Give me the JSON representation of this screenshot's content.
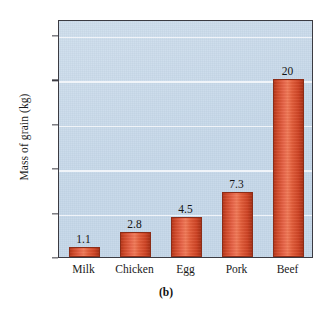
{
  "chart_data": {
    "type": "bar",
    "title": "",
    "subtitle": "",
    "categories": [
      "Milk",
      "Chicken",
      "Egg",
      "Pork",
      "Beef"
    ],
    "values": [
      1.1,
      2.8,
      4.5,
      7.3,
      20
    ],
    "value_labels": [
      "1.1",
      "2.8",
      "4.5",
      "7.3",
      "20"
    ],
    "xlabel": "",
    "ylabel": "Mass of grain (kg)",
    "ylim": [
      0,
      26.8
    ],
    "yticks": [
      0,
      5,
      10,
      15,
      20,
      25
    ],
    "ytick_labels": [
      "0",
      "5",
      "10",
      "15",
      "20",
      "25"
    ],
    "gridlines": [
      5,
      10,
      15,
      20,
      25
    ],
    "grid": true,
    "legend": null,
    "legend_position": "none",
    "caption": "(b)",
    "colors": {
      "plot_background": "#c3d6e8",
      "bar_fill": "#e35f3c",
      "bar_edge": "#8c2d18",
      "gridline": "#f2f6fa",
      "frame": "#3b3b42",
      "text": "#1a1a1a",
      "page_background": "#ffffff"
    }
  }
}
